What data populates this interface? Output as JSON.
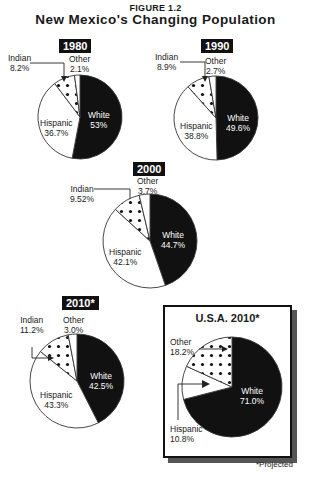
{
  "figure_label": "FIGURE 1.2",
  "title": "New Mexico's Changing Population",
  "footnote": "*Projected",
  "colors": {
    "white": "#111111",
    "hispanic": "#ffffff",
    "indian": "#ffffff",
    "other": "#ffffff",
    "outline": "#333333"
  },
  "pies": [
    {
      "id": "nm-1980",
      "label": "1980",
      "slices": [
        {
          "name": "White",
          "value": "53%"
        },
        {
          "name": "Hispanic",
          "value": "36.7%"
        },
        {
          "name": "Indian",
          "value": "8.2%"
        },
        {
          "name": "Other",
          "value": "2.1%"
        }
      ]
    },
    {
      "id": "nm-1990",
      "label": "1990",
      "slices": [
        {
          "name": "White",
          "value": "49.6%"
        },
        {
          "name": "Hispanic",
          "value": "38.8%"
        },
        {
          "name": "Indian",
          "value": "8.9%"
        },
        {
          "name": "Other",
          "value": "2.7%"
        }
      ]
    },
    {
      "id": "nm-2000",
      "label": "2000",
      "slices": [
        {
          "name": "White",
          "value": "44.7%"
        },
        {
          "name": "Hispanic",
          "value": "42.1%"
        },
        {
          "name": "Indian",
          "value": "9.52%"
        },
        {
          "name": "Other",
          "value": "3.7%"
        }
      ]
    },
    {
      "id": "nm-2010",
      "label": "2010*",
      "slices": [
        {
          "name": "White",
          "value": "42.5%"
        },
        {
          "name": "Hispanic",
          "value": "43.3%"
        },
        {
          "name": "Indian",
          "value": "11.2%"
        },
        {
          "name": "Other",
          "value": "3.0%"
        }
      ]
    },
    {
      "id": "usa-2010",
      "label": "U.S.A. 2010*",
      "slices": [
        {
          "name": "White",
          "value": "71.0%"
        },
        {
          "name": "Hispanic",
          "value": "10.8%"
        },
        {
          "name": "Other",
          "value": "18.2%"
        }
      ]
    }
  ],
  "chart_data": [
    {
      "type": "pie",
      "title": "1980",
      "categories": [
        "White",
        "Hispanic",
        "Indian",
        "Other"
      ],
      "values": [
        53,
        36.7,
        8.2,
        2.1
      ]
    },
    {
      "type": "pie",
      "title": "1990",
      "categories": [
        "White",
        "Hispanic",
        "Indian",
        "Other"
      ],
      "values": [
        49.6,
        38.8,
        8.9,
        2.7
      ]
    },
    {
      "type": "pie",
      "title": "2000",
      "categories": [
        "White",
        "Hispanic",
        "Indian",
        "Other"
      ],
      "values": [
        44.7,
        42.1,
        9.52,
        3.7
      ]
    },
    {
      "type": "pie",
      "title": "2010*",
      "categories": [
        "White",
        "Hispanic",
        "Indian",
        "Other"
      ],
      "values": [
        42.5,
        43.3,
        11.2,
        3.0
      ]
    },
    {
      "type": "pie",
      "title": "U.S.A. 2010*",
      "categories": [
        "White",
        "Hispanic",
        "Other"
      ],
      "values": [
        71.0,
        10.8,
        18.2
      ]
    }
  ]
}
